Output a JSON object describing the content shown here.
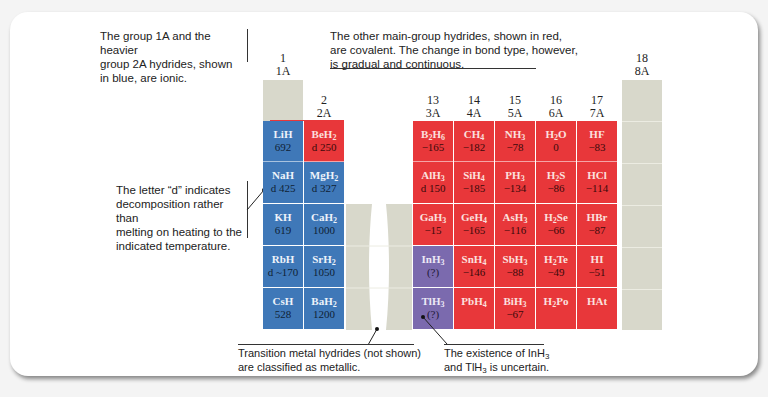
{
  "annotations": {
    "ionic_note": [
      "The group 1A and the heavier",
      "group 2A hydrides, shown",
      "in blue, are ionic."
    ],
    "covalent_note": [
      "The other main-group hydrides, shown in red,",
      "are covalent. The change in bond type, however,",
      "is gradual and continuous."
    ],
    "decomposition_note": [
      "The letter “d” indicates",
      "decomposition rather than",
      "melting on heating to the",
      "indicated temperature."
    ],
    "transition_note": [
      "Transition metal hydrides (not shown)",
      "are classified as metallic."
    ],
    "uncertain_note_line1_pre": "The existence of InH",
    "uncertain_note_line2_pre": "and TlH",
    "uncertain_note_line2_post": " is uncertain.",
    "sub3": "3"
  },
  "groups": [
    {
      "num": "1",
      "label": "1A"
    },
    {
      "num": "2",
      "label": "2A"
    },
    {
      "num": "13",
      "label": "3A"
    },
    {
      "num": "14",
      "label": "4A"
    },
    {
      "num": "15",
      "label": "5A"
    },
    {
      "num": "16",
      "label": "6A"
    },
    {
      "num": "17",
      "label": "7A"
    },
    {
      "num": "18",
      "label": "8A"
    }
  ],
  "colors": {
    "ionic": "#3f78b8",
    "covalent": "#e8373a",
    "uncertain": "#7b6aae",
    "noble_gas": "#d8d8cb"
  },
  "hydrides": {
    "LiH": {
      "f": "LiH",
      "v": "692",
      "type": "ionic"
    },
    "BeH2": {
      "f": "BeH",
      "sub": "2",
      "v": "d 250",
      "type": "covalent"
    },
    "NaH": {
      "f": "NaH",
      "v": "d 425",
      "type": "ionic"
    },
    "MgH2": {
      "f": "MgH",
      "sub": "2",
      "v": "d 327",
      "type": "ionic"
    },
    "KH": {
      "f": "KH",
      "v": "619",
      "type": "ionic"
    },
    "CaH2": {
      "f": "CaH",
      "sub": "2",
      "v": "1000",
      "type": "ionic"
    },
    "RbH": {
      "f": "RbH",
      "v": "d ~170",
      "type": "ionic"
    },
    "SrH2": {
      "f": "SrH",
      "sub": "2",
      "v": "1050",
      "type": "ionic"
    },
    "CsH": {
      "f": "CsH",
      "v": "528",
      "type": "ionic"
    },
    "BaH2": {
      "f": "BaH",
      "sub": "2",
      "v": "1200",
      "type": "ionic"
    },
    "B2H6": {
      "f1": "B",
      "s1": "2",
      "f2": "H",
      "s2": "6",
      "v": "−165",
      "type": "covalent"
    },
    "CH4": {
      "f": "CH",
      "sub": "4",
      "v": "−182",
      "type": "covalent"
    },
    "NH3": {
      "f": "NH",
      "sub": "3",
      "v": "−78",
      "type": "covalent"
    },
    "H2O": {
      "f1": "H",
      "s1": "2",
      "f2": "O",
      "v": "0",
      "type": "covalent"
    },
    "HF": {
      "f": "HF",
      "v": "−83",
      "type": "covalent"
    },
    "AlH3": {
      "f": "AlH",
      "sub": "3",
      "v": "d 150",
      "type": "covalent"
    },
    "SiH4": {
      "f": "SiH",
      "sub": "4",
      "v": "−185",
      "type": "covalent"
    },
    "PH3": {
      "f": "PH",
      "sub": "3",
      "v": "−134",
      "type": "covalent"
    },
    "H2S": {
      "f1": "H",
      "s1": "2",
      "f2": "S",
      "v": "−86",
      "type": "covalent"
    },
    "HCl": {
      "f": "HCl",
      "v": "−114",
      "type": "covalent"
    },
    "GaH3": {
      "f": "GaH",
      "sub": "3",
      "v": "−15",
      "type": "covalent"
    },
    "GeH4": {
      "f": "GeH",
      "sub": "4",
      "v": "−165",
      "type": "covalent"
    },
    "AsH3": {
      "f": "AsH",
      "sub": "3",
      "v": "−116",
      "type": "covalent"
    },
    "H2Se": {
      "f1": "H",
      "s1": "2",
      "f2": "Se",
      "v": "−66",
      "type": "covalent"
    },
    "HBr": {
      "f": "HBr",
      "v": "−87",
      "type": "covalent"
    },
    "InH3": {
      "f": "InH",
      "sub": "3",
      "v": "(?)",
      "type": "uncertain"
    },
    "SnH4": {
      "f": "SnH",
      "sub": "4",
      "v": "−146",
      "type": "covalent"
    },
    "SbH3": {
      "f": "SbH",
      "sub": "3",
      "v": "−88",
      "type": "covalent"
    },
    "H2Te": {
      "f1": "H",
      "s1": "2",
      "f2": "Te",
      "v": "−49",
      "type": "covalent"
    },
    "HI": {
      "f": "HI",
      "v": "−51",
      "type": "covalent"
    },
    "TlH3": {
      "f": "TlH",
      "sub": "3",
      "v": "(?)",
      "type": "uncertain"
    },
    "PbH4": {
      "f": "PbH",
      "sub": "4",
      "v": "",
      "type": "covalent"
    },
    "BiH3": {
      "f": "BiH",
      "sub": "3",
      "v": "−67",
      "type": "covalent"
    },
    "H2Po": {
      "f1": "H",
      "s1": "2",
      "f2": "Po",
      "v": "",
      "type": "covalent"
    },
    "HAt": {
      "f": "HAt",
      "v": "",
      "type": "covalent"
    }
  }
}
